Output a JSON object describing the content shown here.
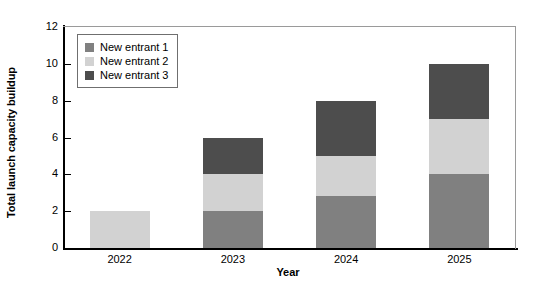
{
  "chart_data": {
    "type": "bar",
    "stacked": true,
    "title": "",
    "xlabel": "Year",
    "ylabel": "Total launch capacity buildup",
    "categories": [
      "2022",
      "2023",
      "2024",
      "2025"
    ],
    "ylim": [
      0,
      12
    ],
    "yticks": [
      0,
      2,
      4,
      6,
      8,
      10,
      12
    ],
    "grid": false,
    "legend_position": "upper left inside",
    "series": [
      {
        "name": "New entrant 1",
        "color": "#808080",
        "values": [
          0,
          2,
          2.8,
          4
        ]
      },
      {
        "name": "New entrant 2",
        "color": "#d2d2d2",
        "values": [
          2,
          2,
          2.2,
          3
        ]
      },
      {
        "name": "New entrant 3",
        "color": "#4d4d4d",
        "values": [
          0,
          2,
          3,
          3
        ]
      }
    ],
    "totals": [
      2,
      6,
      8,
      10
    ]
  },
  "colors": {
    "axis": "#000000",
    "frame": "#9a9a9a",
    "background": "#ffffff",
    "legend_border": "#6f6f6f"
  }
}
